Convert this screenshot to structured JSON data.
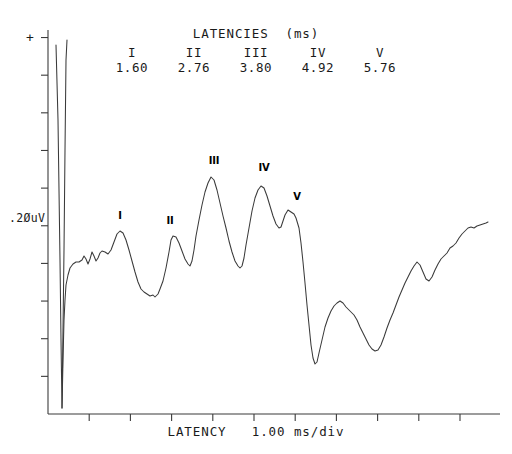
{
  "header": {
    "title": "LATENCIES  (ms)",
    "columns": [
      {
        "roman": "I",
        "value": "1.60"
      },
      {
        "roman": "II",
        "value": "2.76"
      },
      {
        "roman": "III",
        "value": "3.80"
      },
      {
        "roman": "IV",
        "value": "4.92"
      },
      {
        "roman": "V",
        "value": "5.76"
      }
    ]
  },
  "axes": {
    "polarity_marker": "+",
    "y_label": ".2ØuV",
    "x_label": "LATENCY   1.00 ms/div",
    "x_tick_count": 11,
    "y_tick_count": 10,
    "axis_color": "#3b3b3b",
    "trace_color": "#3a3a3a"
  },
  "peaks": [
    {
      "label": "I",
      "x": 120,
      "y": 229
    },
    {
      "label": "II",
      "x": 170,
      "y": 234
    },
    {
      "label": "III",
      "x": 214,
      "y": 174
    },
    {
      "label": "IV",
      "x": 264,
      "y": 181
    },
    {
      "label": "V",
      "x": 297,
      "y": 210
    }
  ],
  "chart_data": {
    "type": "line",
    "title": "LATENCIES  (ms)",
    "xlabel": "LATENCY   1.00 ms/div",
    "ylabel": ".2ØuV",
    "grid": false,
    "legend": "none",
    "x_unit": "ms",
    "x_per_division": 1.0,
    "y_per_division": 0.2,
    "y_unit": "uV",
    "polarity_up": "positive",
    "annotations": [
      {
        "name": "I",
        "latency_ms": 1.6
      },
      {
        "name": "II",
        "latency_ms": 2.76
      },
      {
        "name": "III",
        "latency_ms": 3.8
      },
      {
        "name": "IV",
        "latency_ms": 4.92
      },
      {
        "name": "V",
        "latency_ms": 5.76
      }
    ],
    "series": [
      {
        "name": "ABR waveform",
        "comment": "pixel-space polyline points, x,y in screenshot coordinates",
        "artifact_points": "56,45 58,120 60,260 61,340 62,408 63,330 64,250 65,150 66,60 67,40",
        "points": "62,408 63,360 64,320 65,300 66,285 68,275 70,268 73,264 76,262 79,262 82,260 84,256 86,259 88,264 90,259 92,252 94,256 96,261 98,258 100,253 102,251 105,252 108,254 111,250 114,242 117,234 120,231 123,233 126,240 129,250 132,261 135,272 138,282 141,289 144,292 147,294 150,296 153,295 155,297 158,294 160,289 163,281 166,268 169,252 171,240 173,236 176,237 179,243 182,251 185,259 188,264 190,266 192,261 194,250 196,236 199,220 202,205 205,192 208,183 211,177 214,180 217,190 220,203 223,216 226,228 229,241 232,252 235,261 238,266 240,268 242,266 244,258 246,245 249,228 252,211 255,198 258,190 261,186 264,188 267,196 270,206 273,216 276,224 279,228 281,227 283,221 285,215 288,210 291,212 294,214 296,218 299,228 301,243 303,262 305,283 307,305 309,325 311,345 313,358 315,364 317,362 319,353 322,340 325,327 328,318 331,311 334,306 337,303 340,301 343,303 346,307 349,310 351,312 354,315 357,320 360,327 363,333 366,339 369,345 372,349 375,351 378,350 381,345 384,337 387,328 390,320 393,313 396,305 399,297 402,290 405,283 408,277 411,271 414,266 417,262 420,265 423,272 426,279 429,281 432,277 435,270 438,264 441,259 444,256 447,253 450,248 453,246 456,243 459,238 462,234 465,231 468,228 471,227 474,228 477,226 480,225 483,224 486,223 488,222"
      }
    ]
  }
}
